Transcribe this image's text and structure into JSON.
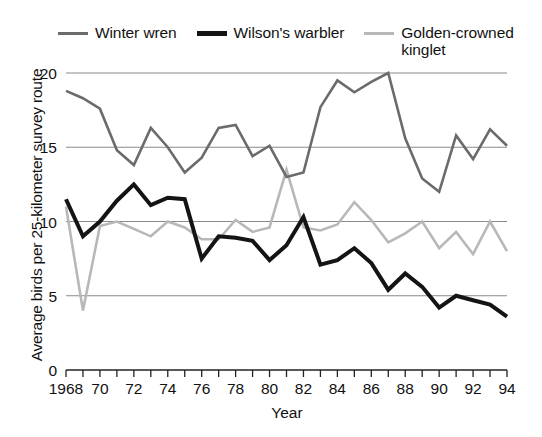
{
  "chart_data": {
    "type": "line",
    "title": "",
    "xlabel": "Year",
    "ylabel": "Average birds per 25-kilometer survey route",
    "xlim": [
      1968,
      1994
    ],
    "ylim": [
      0,
      20
    ],
    "yticks": [
      0,
      5,
      10,
      15,
      20
    ],
    "ytick_labels": [
      "0",
      "5",
      "10",
      "15",
      "20"
    ],
    "xticks": [
      1968,
      1970,
      1972,
      1974,
      1976,
      1978,
      1980,
      1982,
      1984,
      1986,
      1988,
      1990,
      1992,
      1994
    ],
    "xtick_labels": [
      "1968",
      "70",
      "72",
      "74",
      "76",
      "78",
      "80",
      "82",
      "84",
      "86",
      "88",
      "90",
      "92",
      "94"
    ],
    "x": [
      1968,
      1969,
      1970,
      1971,
      1972,
      1973,
      1974,
      1975,
      1976,
      1977,
      1978,
      1979,
      1980,
      1981,
      1982,
      1983,
      1984,
      1985,
      1986,
      1987,
      1988,
      1989,
      1990,
      1991,
      1992,
      1993,
      1994
    ],
    "grid": "horizontal",
    "legend_position": "top",
    "series": [
      {
        "name": "Winter wren",
        "color": "#6b6b6b",
        "width": 2.6,
        "values": [
          18.8,
          18.3,
          17.6,
          14.8,
          13.8,
          16.3,
          15.0,
          13.3,
          14.3,
          16.3,
          16.5,
          14.4,
          15.1,
          13.0,
          13.3,
          17.7,
          19.5,
          18.7,
          19.4,
          20.0,
          15.6,
          12.9,
          12.0,
          15.8,
          14.2,
          16.2,
          15.1
        ]
      },
      {
        "name": "Wilson's warbler",
        "color": "#141414",
        "width": 4.0,
        "values": [
          11.5,
          9.0,
          10.0,
          11.4,
          12.5,
          11.1,
          11.6,
          11.5,
          7.5,
          9.0,
          8.9,
          8.7,
          7.4,
          8.4,
          10.3,
          7.1,
          7.4,
          8.2,
          7.2,
          5.4,
          6.5,
          5.6,
          4.2,
          5.0,
          4.7,
          4.4,
          3.6
        ]
      },
      {
        "name": "Golden-crowned\nkinglet",
        "color": "#b8b8b8",
        "width": 2.6,
        "values": [
          11.0,
          4.0,
          9.7,
          10.0,
          9.5,
          9.0,
          10.0,
          9.6,
          8.8,
          8.8,
          10.1,
          9.3,
          9.6,
          13.5,
          9.6,
          9.4,
          9.8,
          11.3,
          10.1,
          8.6,
          9.2,
          10.0,
          8.2,
          9.3,
          7.8,
          10.0,
          8.0
        ]
      }
    ]
  },
  "legend": {
    "items": [
      {
        "label": "Winter wren",
        "color": "#6b6b6b",
        "thick": false
      },
      {
        "label": "Wilson's warbler",
        "color": "#141414",
        "thick": true
      },
      {
        "label": "Golden-crowned\nkinglet",
        "color": "#b8b8b8",
        "thick": false
      }
    ]
  },
  "axes": {
    "x_title": "Year",
    "y_title": "Average birds per 25-kilometer survey route"
  }
}
